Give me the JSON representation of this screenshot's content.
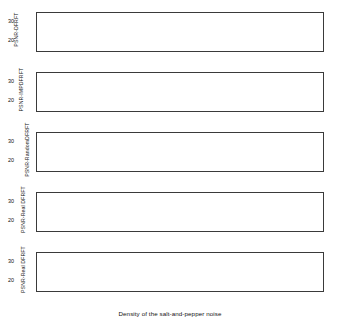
{
  "figure": {
    "background": "#ffffff",
    "axis_color": "#3a3a3a",
    "curve_color": "#5a5a5a",
    "marker_color": "#000000",
    "width": 340,
    "height": 325
  },
  "xlabel": "Density of the salt-and-pepper noise",
  "xticks": [
    0.005,
    0.01,
    0.015,
    0.02,
    0.025,
    0.03,
    0.035,
    0.04,
    0.045,
    0.05
  ],
  "xticklabels": [
    "0.005",
    "0.01",
    "0.015",
    "0.02",
    "0.025",
    "0.03",
    "0.035",
    "0.04",
    "0.045",
    "0.05"
  ],
  "yticklabels": [
    "30",
    "20"
  ],
  "chart_data": {
    "type": "line",
    "title": "",
    "xlabel": "Density of the salt-and-pepper noise",
    "ylabel": "PSNR (dB)",
    "xlim": [
      0.001,
      0.05
    ],
    "ylim": [
      17.5,
      32.5
    ],
    "yticks": [
      20,
      30
    ],
    "grid": false,
    "legend": false,
    "panels": [
      {
        "index": 0,
        "ylabel": "PSNR-DFRFT",
        "x": [
          0.001,
          0.0025,
          0.005,
          0.0075,
          0.01,
          0.0125,
          0.015,
          0.0175,
          0.02,
          0.0225,
          0.025,
          0.0275,
          0.03,
          0.0325,
          0.035,
          0.0375,
          0.04,
          0.0425,
          0.045,
          0.0475,
          0.05
        ],
        "y": [
          30.0,
          28.4,
          26.6,
          25.3,
          24.3,
          23.6,
          23.0,
          22.5,
          22.1,
          21.7,
          21.4,
          21.1,
          20.8,
          20.5,
          20.3,
          20.0,
          19.8,
          19.6,
          19.4,
          19.2,
          19.0
        ],
        "marker": {
          "x": 0.037,
          "y": 20.1,
          "shape": "filled-square"
        }
      },
      {
        "index": 1,
        "ylabel": "PSNR-IMPDFRFT",
        "x": [
          0.001,
          0.0025,
          0.005,
          0.0075,
          0.01,
          0.0125,
          0.015,
          0.0175,
          0.02,
          0.0225,
          0.025,
          0.0275,
          0.03,
          0.0325,
          0.035,
          0.0375,
          0.04,
          0.0425,
          0.045,
          0.0475,
          0.05
        ],
        "y": [
          30.1,
          28.1,
          26.0,
          24.6,
          23.6,
          22.9,
          22.3,
          21.8,
          21.4,
          21.0,
          20.7,
          20.4,
          20.1,
          19.8,
          19.6,
          19.4,
          19.2,
          19.0,
          18.9,
          18.8,
          18.7
        ],
        "marker": {
          "x": 0.039,
          "y": 19.3,
          "shape": "filled-square"
        }
      },
      {
        "index": 2,
        "ylabel": "PSNR-RandomDFRFT",
        "x": [
          0.001,
          0.0025,
          0.005,
          0.0075,
          0.01,
          0.0125,
          0.015,
          0.0175,
          0.02,
          0.0225,
          0.025,
          0.0275,
          0.03,
          0.0325,
          0.035,
          0.0375,
          0.04,
          0.0425,
          0.045,
          0.0475,
          0.05
        ],
        "y": [
          29.9,
          28.2,
          26.4,
          25.1,
          24.2,
          23.5,
          22.9,
          22.4,
          22.0,
          21.6,
          21.3,
          21.0,
          20.7,
          20.4,
          20.2,
          19.9,
          19.7,
          19.5,
          19.3,
          19.1,
          18.9
        ],
        "marker": {
          "x": 0.044,
          "y": 19.4,
          "shape": "filled-square"
        }
      },
      {
        "index": 3,
        "ylabel": "PSNR-Real DFRFT",
        "x": [
          0.001,
          0.0025,
          0.005,
          0.0075,
          0.01,
          0.0125,
          0.015,
          0.0175,
          0.02,
          0.0225,
          0.025,
          0.0275,
          0.03,
          0.0325,
          0.035,
          0.0375,
          0.04,
          0.0425,
          0.045,
          0.0475,
          0.05
        ],
        "y": [
          28.7,
          27.4,
          26.0,
          25.0,
          24.3,
          23.7,
          23.2,
          22.8,
          22.4,
          22.0,
          21.7,
          21.4,
          21.1,
          20.8,
          20.6,
          20.4,
          20.2,
          20.0,
          19.8,
          19.6,
          19.4
        ],
        "marker": {
          "x": 0.028,
          "y": 21.3,
          "shape": "filled-square"
        }
      },
      {
        "index": 4,
        "ylabel": "PSNR-Real DFRFT",
        "x": [
          0.001,
          0.0025,
          0.005,
          0.0075,
          0.01,
          0.0125,
          0.015,
          0.0175,
          0.02,
          0.0225,
          0.025,
          0.0275,
          0.03,
          0.0325,
          0.035,
          0.0375,
          0.04,
          0.0425,
          0.045,
          0.0475,
          0.05
        ],
        "y": [
          28.5,
          27.2,
          25.8,
          24.9,
          24.2,
          23.6,
          23.1,
          22.7,
          22.3,
          22.0,
          21.7,
          21.4,
          21.1,
          20.9,
          20.6,
          20.4,
          20.2,
          20.0,
          19.8,
          19.6,
          19.4
        ],
        "marker": {
          "x": 0.029,
          "y": 21.0,
          "shape": "filled-square"
        }
      }
    ]
  }
}
